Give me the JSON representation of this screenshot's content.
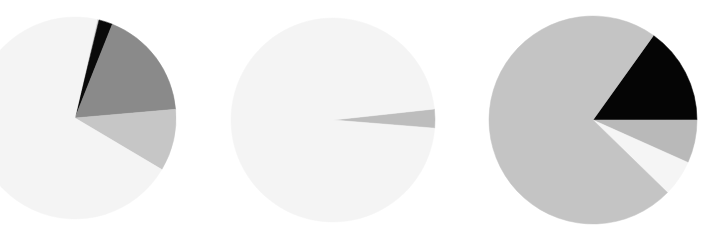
{
  "chart_data": [
    {
      "type": "pie",
      "title": "",
      "center": [
        75,
        118
      ],
      "radius": 101,
      "start_angle_deg": 12.7,
      "legend": "none",
      "slices": [
        {
          "label": "",
          "value": 0.3,
          "color": "#d8d8d8"
        },
        {
          "label": "",
          "value": 2.2,
          "color": "#0a0a0a"
        },
        {
          "label": "",
          "value": 17.6,
          "color": "#8a8a8a"
        },
        {
          "label": "",
          "value": 9.9,
          "color": "#c6c6c6"
        },
        {
          "label": "",
          "value": 70.0,
          "color": "#f4f4f4"
        }
      ]
    },
    {
      "type": "pie",
      "title": "",
      "center": [
        333,
        120
      ],
      "radius": 102,
      "start_angle_deg": 83.8,
      "legend": "none",
      "slices": [
        {
          "label": "",
          "value": 3.0,
          "color": "#bdbdbd"
        },
        {
          "label": "",
          "value": 97.0,
          "color": "#f4f4f4"
        }
      ]
    },
    {
      "type": "pie",
      "title": "",
      "center": [
        593,
        120
      ],
      "radius": 104,
      "start_angle_deg": 35.6,
      "legend": "none",
      "slices": [
        {
          "label": "",
          "value": 15.1,
          "color": "#050505"
        },
        {
          "label": "",
          "value": 6.7,
          "color": "#b9b9b9"
        },
        {
          "label": "",
          "value": 5.6,
          "color": "#f5f5f5"
        },
        {
          "label": "",
          "value": 72.6,
          "color": "#c4c4c4"
        }
      ]
    }
  ]
}
